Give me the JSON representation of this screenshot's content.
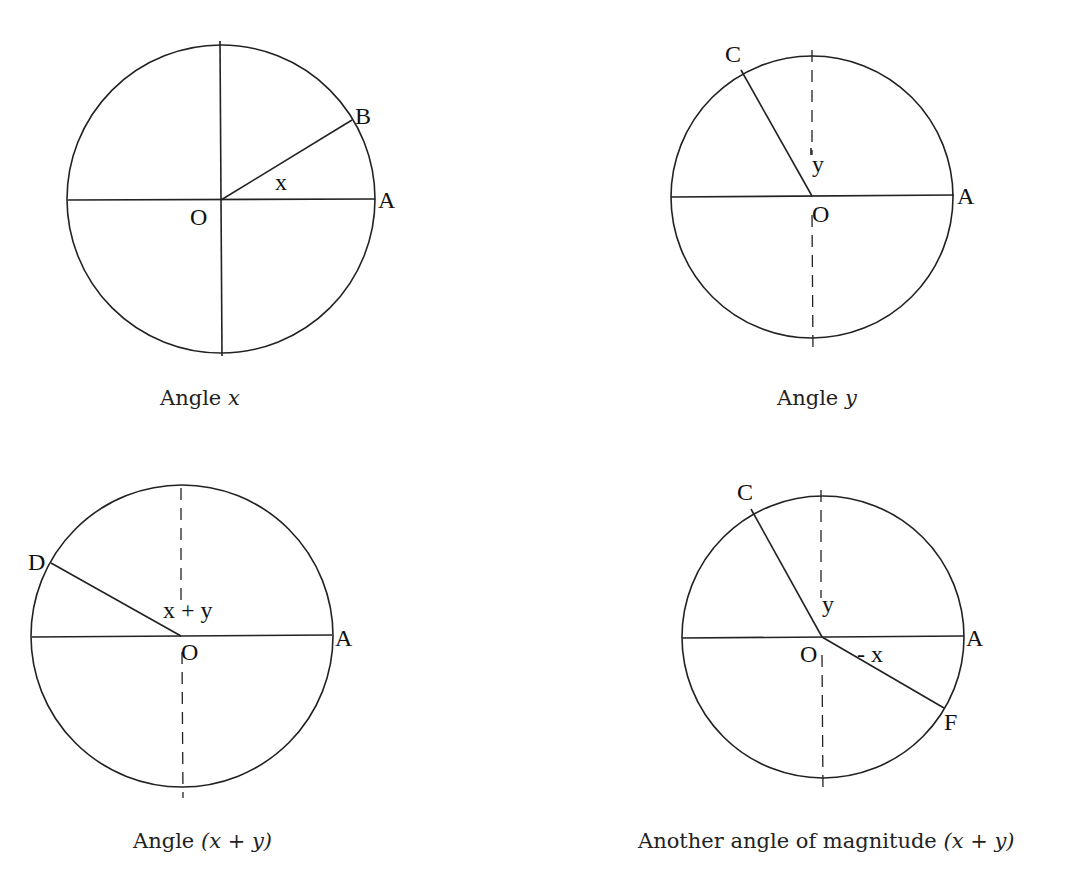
{
  "diagrams": [
    {
      "caption_prefix": "Angle ",
      "caption_math": "x",
      "caption_suffix": "",
      "labels": {
        "O": "O",
        "A": "A",
        "B": "B",
        "angle": "x"
      }
    },
    {
      "caption_prefix": "Angle ",
      "caption_math": "y",
      "caption_suffix": "",
      "labels": {
        "O": "O",
        "A": "A",
        "C": "C",
        "angle": "y"
      }
    },
    {
      "caption_prefix": "Angle ",
      "caption_math": "(x + y)",
      "caption_suffix": "",
      "labels": {
        "O": "O",
        "A": "A",
        "D": "D",
        "angle": "x + y"
      }
    },
    {
      "caption_prefix": "Another angle of magnitude ",
      "caption_math": "(x + y)",
      "caption_suffix": "",
      "labels": {
        "O": "O",
        "A": "A",
        "C": "C",
        "F": "F",
        "angle_y": "y",
        "angle_neg_x": "- x"
      }
    }
  ]
}
